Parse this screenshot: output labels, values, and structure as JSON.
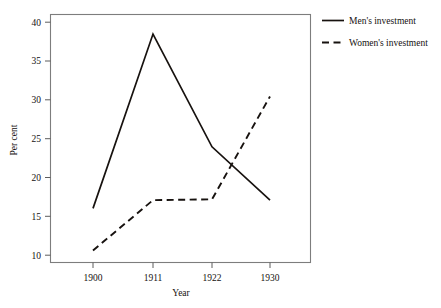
{
  "chart_data": {
    "type": "line",
    "title": "",
    "subtitle": "",
    "xlabel": "Year",
    "ylabel": "Per cent",
    "categories": [
      "1900",
      "1911",
      "1922",
      "1930"
    ],
    "x": [
      1900,
      1911,
      1922,
      1930
    ],
    "xtick_labels": [
      "1900",
      "1911",
      "1922",
      "1930"
    ],
    "ytick_labels": [
      "10",
      "15",
      "20",
      "25",
      "30",
      "35",
      "40"
    ],
    "yticks": [
      10,
      15,
      20,
      25,
      30,
      35,
      40
    ],
    "ylim": [
      8.5,
      41.5
    ],
    "xlim": [
      1893,
      1937
    ],
    "grid": false,
    "legend_position": "right-outside",
    "series": [
      {
        "name": "Men's investment",
        "style": "solid",
        "color": "#17120f",
        "values": [
          15.7,
          38.9,
          23.9,
          16.8
        ]
      },
      {
        "name": "Women's investment",
        "style": "dashed",
        "color": "#17120f",
        "values": [
          10.1,
          16.8,
          16.9,
          30.6
        ]
      }
    ],
    "legend": [
      {
        "label": "Men's investment",
        "style": "solid"
      },
      {
        "label": "Women's investment",
        "style": "dashed"
      }
    ],
    "annotations": []
  },
  "axes": {
    "y_tick_0": "10",
    "y_tick_1": "15",
    "y_tick_2": "20",
    "y_tick_3": "25",
    "y_tick_4": "30",
    "y_tick_5": "35",
    "y_tick_6": "40",
    "x_tick_0": "1900",
    "x_tick_1": "1911",
    "x_tick_2": "1922",
    "x_tick_3": "1930",
    "x_axis_title": "Year",
    "y_axis_title": "Per cent"
  },
  "legend": {
    "item_0_label": "Men's investment",
    "item_1_label": "Women's investment"
  }
}
